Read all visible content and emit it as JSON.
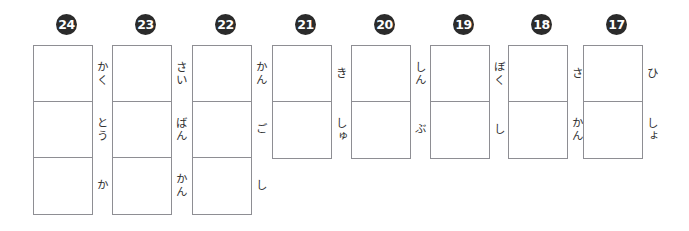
{
  "worksheet": {
    "type": "kanji-writing-practice",
    "writing_direction": "vertical",
    "box_border_color": "#8e8e93",
    "badge_color": "#2b2b2b",
    "badge_text_color": "#ffffff",
    "problems": [
      {
        "number": "24",
        "left": 33,
        "badge_left": 56,
        "cell_count": 3,
        "readings": [
          "かく",
          "とう",
          "か"
        ]
      },
      {
        "number": "23",
        "left": 112,
        "badge_left": 135,
        "cell_count": 3,
        "readings": [
          "さい",
          "ばん",
          "かん"
        ]
      },
      {
        "number": "22",
        "left": 192,
        "badge_left": 215,
        "cell_count": 3,
        "readings": [
          "かん",
          "ご",
          "し"
        ]
      },
      {
        "number": "21",
        "left": 272,
        "badge_left": 295,
        "cell_count": 2,
        "readings": [
          "き",
          "しゅ"
        ]
      },
      {
        "number": "20",
        "left": 351,
        "badge_left": 374,
        "cell_count": 2,
        "readings": [
          "しん",
          "ぶ"
        ]
      },
      {
        "number": "19",
        "left": 430,
        "badge_left": 453,
        "cell_count": 2,
        "readings": [
          "ぼく",
          "し"
        ]
      },
      {
        "number": "18",
        "left": 508,
        "badge_left": 531,
        "cell_count": 2,
        "readings": [
          "さ",
          "かん"
        ]
      },
      {
        "number": "17",
        "left": 583,
        "badge_left": 606,
        "cell_count": 2,
        "readings": [
          "ひ",
          "しょ"
        ]
      }
    ]
  }
}
